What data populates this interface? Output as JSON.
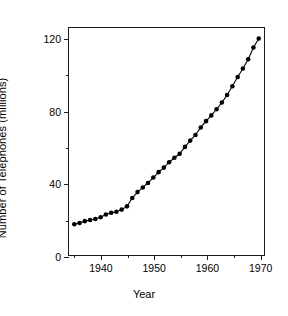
{
  "chart_data": {
    "type": "line",
    "title": "",
    "xlabel": "Year",
    "ylabel": "Number of Telephones (millions)",
    "xlim": [
      1934,
      1971
    ],
    "ylim": [
      0,
      126
    ],
    "xticks": [
      1940,
      1950,
      1960,
      1970
    ],
    "xticklabels": [
      "1940",
      "1950",
      "1960",
      "1970"
    ],
    "xminorticks": [
      1935,
      1945,
      1955,
      1965
    ],
    "yticks": [
      0,
      40,
      80,
      120
    ],
    "yticklabels": [
      "0",
      "40",
      "80",
      "120"
    ],
    "yminorticks": [
      20,
      60,
      100
    ],
    "grid": false,
    "legend": false,
    "marker": "filled-circle",
    "marker_color": "#000000",
    "line_color": "#000000",
    "x": [
      1935,
      1936,
      1937,
      1938,
      1939,
      1940,
      1941,
      1942,
      1943,
      1944,
      1945,
      1946,
      1947,
      1948,
      1949,
      1950,
      1951,
      1952,
      1953,
      1954,
      1955,
      1956,
      1957,
      1958,
      1959,
      1960,
      1961,
      1962,
      1963,
      1964,
      1965,
      1966,
      1967,
      1968,
      1969,
      1970
    ],
    "values": [
      17.1,
      17.8,
      18.8,
      19.4,
      20.0,
      21.0,
      22.5,
      23.4,
      24.0,
      25.2,
      27.0,
      31.6,
      34.9,
      37.5,
      40.0,
      43.0,
      46.0,
      48.5,
      51.5,
      54.0,
      56.2,
      60.0,
      63.5,
      66.6,
      70.8,
      74.3,
      77.5,
      80.9,
      84.6,
      88.8,
      93.7,
      98.8,
      103.5,
      108.7,
      115.2,
      120.2
    ]
  }
}
